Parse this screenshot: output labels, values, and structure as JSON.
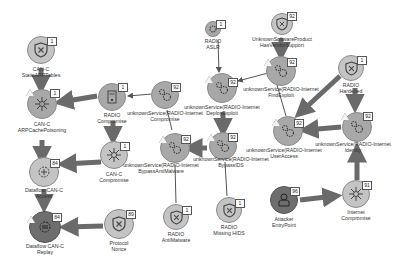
{
  "diagram": {
    "type": "attack-graph",
    "colors": {
      "node_fill": "#a8a8a8",
      "node_fill_light": "#c4c4c4",
      "node_fill_dark": "#6e6e6e",
      "edge": "#6a6a6a",
      "badge_bg": "#ffffff",
      "background": "#ffffff"
    },
    "nodes": [
      {
        "id": "can_static_arp",
        "line1": "CAN-C",
        "line2": "StaticARPTables",
        "badge": "1",
        "icon": "shield-x-icon"
      },
      {
        "id": "can_arp_poison",
        "line1": "CAN-C",
        "line2": "ARPCachePoisoning",
        "badge": "1",
        "icon": "network-hub-icon",
        "warning": true
      },
      {
        "id": "radio_compromise",
        "line1": "RADIO",
        "line2": "Compromise",
        "badge": "1",
        "icon": "device-icon"
      },
      {
        "id": "radio_aslr",
        "line1": "RADIO",
        "line2": "ASLR",
        "badge": "1",
        "icon": "gears-icon"
      },
      {
        "id": "unk_vendor_support",
        "line1": "UnknownSoftwareProduct",
        "line2": "HasVendorSupport",
        "badge": "92",
        "icon": "shield-x-icon"
      },
      {
        "id": "unk_compromise",
        "line1": "unknownService(RADIO-Internet",
        "line2": "Compromise",
        "badge": "92",
        "icon": "gears-icon"
      },
      {
        "id": "unk_deploy_exploit",
        "line1": "unknownService(RADIO-Internet",
        "line2": "DeployExploit",
        "badge": "92",
        "icon": "gears-icon",
        "warning": true
      },
      {
        "id": "unk_find_exploit",
        "line1": "unknownService(RADIO-Internet",
        "line2": "FindExploit",
        "badge": "92",
        "icon": "gears-icon",
        "warning": true
      },
      {
        "id": "radio_hardened",
        "line1": "RADIO",
        "line2": "Hardened",
        "badge": "1",
        "icon": "shield-x-icon"
      },
      {
        "id": "can_compromise",
        "line1": "CAN-C",
        "line2": "Compromise",
        "badge": "1",
        "icon": "network-hub-icon"
      },
      {
        "id": "unk_bypass_antimalware",
        "line1": "unknownService(RADIO-Internet",
        "line2": "BypassAntiMalware",
        "badge": "92",
        "icon": "gears-icon",
        "warning": true
      },
      {
        "id": "unk_bypass_ids",
        "line1": "unknownService(RADIO-Internet",
        "line2": "BypassIDS",
        "badge": "92",
        "icon": "gears-icon",
        "warning": true
      },
      {
        "id": "unk_user_access",
        "line1": "unknownService(RADIO-Internet",
        "line2": "UserAccess",
        "badge": "92",
        "icon": "gears-icon",
        "warning": true
      },
      {
        "id": "unk_identity",
        "line1": "unknownService(RADIO-Internet",
        "line2": "Identity",
        "badge": "92",
        "icon": "gears-icon",
        "warning": true
      },
      {
        "id": "dataflow_access",
        "line1": "Dataflow CAN-C",
        "line2": "Access",
        "badge": "84",
        "icon": "dataflow-icon"
      },
      {
        "id": "dataflow_replay",
        "line1": "Dataflow CAN-C",
        "line2": "Replay",
        "badge": "84",
        "icon": "dataflow-icon",
        "warning": true
      },
      {
        "id": "protocol_nonce",
        "line1": "Protocol",
        "line2": "Nonce",
        "badge": "89",
        "icon": "shield-x-icon"
      },
      {
        "id": "radio_antimalware",
        "line1": "RADIO",
        "line2": "AntiMalware",
        "badge": "1",
        "icon": "shield-x-icon"
      },
      {
        "id": "radio_missing_hids",
        "line1": "RADIO",
        "line2": "Missing HIDS",
        "badge": "1",
        "icon": "shield-x-icon"
      },
      {
        "id": "attacker_entry",
        "line1": "Attacker",
        "line2": "EntryPoint",
        "badge": "96",
        "icon": "attacker-icon"
      },
      {
        "id": "internet_compromise",
        "line1": "Internet",
        "line2": "Compromise",
        "badge": "91",
        "icon": "network-hub-icon"
      }
    ],
    "edges": [
      {
        "from": "can_static_arp",
        "to": "can_arp_poison",
        "weight": "thick"
      },
      {
        "from": "radio_compromise",
        "to": "can_arp_poison",
        "weight": "thick"
      },
      {
        "from": "can_arp_poison",
        "to": "dataflow_access",
        "weight": "thick"
      },
      {
        "from": "radio_compromise",
        "to": "can_compromise",
        "weight": "thick"
      },
      {
        "from": "can_compromise",
        "to": "dataflow_access",
        "weight": "thick"
      },
      {
        "from": "dataflow_access",
        "to": "dataflow_replay",
        "weight": "thick"
      },
      {
        "from": "protocol_nonce",
        "to": "dataflow_replay",
        "weight": "thick"
      },
      {
        "from": "unk_compromise",
        "to": "radio_compromise",
        "weight": "thin"
      },
      {
        "from": "radio_aslr",
        "to": "unk_deploy_exploit",
        "weight": "thin"
      },
      {
        "from": "unk_find_exploit",
        "to": "unk_deploy_exploit",
        "weight": "thin"
      },
      {
        "from": "unk_vendor_support",
        "to": "unk_find_exploit",
        "weight": "thick"
      },
      {
        "from": "unk_deploy_exploit",
        "to": "unk_bypass_ids",
        "weight": "thick"
      },
      {
        "from": "unk_bypass_ids",
        "to": "unk_bypass_antimalware",
        "weight": "thick"
      },
      {
        "from": "unk_bypass_antimalware",
        "to": "unk_compromise",
        "weight": "thin"
      },
      {
        "from": "radio_antimalware",
        "to": "unk_bypass_antimalware",
        "weight": "thin"
      },
      {
        "from": "radio_missing_hids",
        "to": "unk_bypass_ids",
        "weight": "thin"
      },
      {
        "from": "unk_find_exploit",
        "to": "unk_user_access",
        "weight": "thin"
      },
      {
        "from": "radio_hardened",
        "to": "unk_user_access",
        "weight": "thick"
      },
      {
        "from": "radio_hardened",
        "to": "unk_identity",
        "weight": "thick"
      },
      {
        "from": "unk_identity",
        "to": "unk_user_access",
        "weight": "thick"
      },
      {
        "from": "internet_compromise",
        "to": "unk_identity",
        "weight": "thick"
      },
      {
        "from": "attacker_entry",
        "to": "internet_compromise",
        "weight": "thick"
      }
    ]
  }
}
